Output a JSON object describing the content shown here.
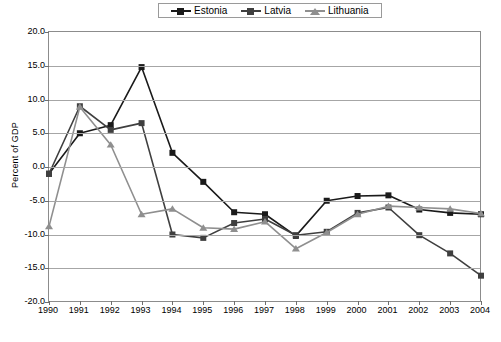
{
  "chart_data": {
    "type": "line",
    "title": "",
    "xlabel": "",
    "ylabel": "Percent of GDP",
    "x": [
      1990,
      1991,
      1992,
      1993,
      1994,
      1995,
      1996,
      1997,
      1998,
      1999,
      2000,
      2001,
      2002,
      2003,
      2004
    ],
    "xtick_labels": [
      "1990",
      "1991",
      "1992",
      "1993",
      "1994",
      "1995",
      "1996",
      "1997",
      "1998",
      "1999",
      "2000",
      "2001",
      "2002",
      "2003",
      "2004"
    ],
    "ytick_labels": [
      "20.0",
      "15.0",
      "10.0",
      "5.0",
      "0.0",
      "-5.0",
      "-10.0",
      "-15.0",
      "-20.0"
    ],
    "ytick_values": [
      20.0,
      15.0,
      10.0,
      5.0,
      0.0,
      -5.0,
      -10.0,
      -15.0,
      -20.0
    ],
    "ylim": [
      -20.0,
      20.0
    ],
    "xlim": [
      1990,
      2004
    ],
    "grid": true,
    "legend_position": "top-center",
    "series": [
      {
        "name": "Estonia",
        "color": "#1a1a1a",
        "marker": "square",
        "values": [
          -1.0,
          5.0,
          6.2,
          14.8,
          2.1,
          -2.2,
          -6.7,
          -7.0,
          -10.2,
          -5.0,
          -4.3,
          -4.2,
          -6.3,
          -6.8,
          -7.0
        ]
      },
      {
        "name": "Latvia",
        "color": "#3f3f3f",
        "marker": "square",
        "values": [
          -1.0,
          9.0,
          5.5,
          6.5,
          -10.0,
          -10.5,
          -8.3,
          -7.7,
          -10.1,
          -9.6,
          -6.8,
          -6.0,
          -10.1,
          -12.8,
          -16.1
        ]
      },
      {
        "name": "Lithuania",
        "color": "#8f8f8f",
        "marker": "triangle",
        "values": [
          -8.8,
          8.9,
          3.3,
          -7.0,
          -6.2,
          -9.0,
          -9.2,
          -8.1,
          -12.1,
          -9.7,
          -7.0,
          -5.8,
          -6.0,
          -6.2,
          -6.9
        ]
      }
    ]
  },
  "legend": {
    "items": [
      {
        "label": "Estonia"
      },
      {
        "label": "Latvia"
      },
      {
        "label": "Lithuania"
      }
    ]
  },
  "axes": {
    "y_title": "Percent of GDP"
  },
  "caption": {
    "text": ""
  }
}
